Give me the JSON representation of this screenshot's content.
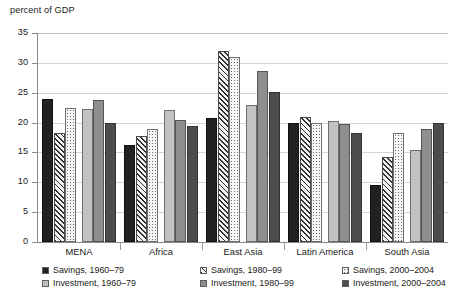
{
  "axis_title": "percent of GDP",
  "y_ticks": [
    "0",
    "5",
    "10",
    "15",
    "20",
    "25",
    "30",
    "35"
  ],
  "categories": [
    "MENA",
    "Africa",
    "East Asia",
    "Latin America",
    "South Asia"
  ],
  "legend": [
    {
      "label": "Savings, 1960–79",
      "swatch": "solid-black-swatch"
    },
    {
      "label": "Savings, 1980–99",
      "swatch": "hatched-swatch"
    },
    {
      "label": "Savings, 2000–2004",
      "swatch": "dotted-swatch"
    },
    {
      "label": "Investment, 1960–79",
      "swatch": "light-gray-swatch"
    },
    {
      "label": "Investment, 1980–99",
      "swatch": "mid-gray-swatch"
    },
    {
      "label": "Investment, 2000–2004",
      "swatch": "dark-gray-swatch"
    }
  ],
  "chart_data": {
    "type": "bar",
    "title": "",
    "subtitle": "",
    "xlabel": "",
    "ylabel": "percent of GDP",
    "ylim": [
      0,
      35
    ],
    "ytick_step": 5,
    "grid": true,
    "grid_axis": "y",
    "legend_position": "bottom",
    "categories": [
      "MENA",
      "Africa",
      "East Asia",
      "Latin America",
      "South Asia"
    ],
    "series": [
      {
        "name": "Savings, 1960–79",
        "values": [
          24.0,
          16.2,
          20.8,
          19.9,
          9.5
        ]
      },
      {
        "name": "Savings, 1980–99",
        "values": [
          18.3,
          17.8,
          32.0,
          20.9,
          14.2
        ]
      },
      {
        "name": "Savings, 2000–2004",
        "values": [
          22.5,
          19.0,
          31.0,
          20.0,
          18.3
        ]
      },
      {
        "name": "Investment, 1960–79",
        "values": [
          22.2,
          22.1,
          23.0,
          20.2,
          15.4
        ]
      },
      {
        "name": "Investment, 1980–99",
        "values": [
          23.7,
          20.4,
          28.6,
          19.8,
          18.9
        ]
      },
      {
        "name": "Investment, 2000–2004",
        "values": [
          20.0,
          19.5,
          25.1,
          18.2,
          19.9
        ]
      }
    ]
  }
}
